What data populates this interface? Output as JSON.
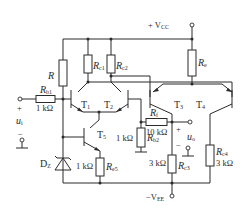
{
  "diagram": {
    "type": "circuit-schematic",
    "supplies": {
      "vcc": {
        "prefix": "+ V",
        "sub": "CC"
      },
      "vee": {
        "prefix": "−V",
        "sub": "EE"
      }
    },
    "transistors": [
      {
        "id": "T1",
        "label": "T",
        "sub": "1"
      },
      {
        "id": "T2",
        "label": "T",
        "sub": "2"
      },
      {
        "id": "T3",
        "label": "T",
        "sub": "3"
      },
      {
        "id": "T4",
        "label": "T",
        "sub": "4"
      },
      {
        "id": "T5",
        "label": "T",
        "sub": "5"
      }
    ],
    "resistors": {
      "R": {
        "label": "R",
        "sub": ""
      },
      "Rb1": {
        "label": "R",
        "sub": "b1",
        "value": "1 kΩ"
      },
      "Rc1": {
        "label": "R",
        "sub": "c1"
      },
      "Rc2": {
        "label": "R",
        "sub": "c2"
      },
      "Re": {
        "label": "R",
        "sub": "e"
      },
      "Re5": {
        "label": "R",
        "sub": "e5",
        "value": "1 kΩ"
      },
      "Rb2": {
        "label": "R",
        "sub": "b2",
        "value": "1 kΩ"
      },
      "Rf": {
        "label": "R",
        "sub": "f",
        "value": "10 kΩ"
      },
      "Rc3": {
        "label": "R",
        "sub": "c3",
        "value": "3 kΩ"
      },
      "Rc4": {
        "label": "R",
        "sub": "c4",
        "value": "3 kΩ"
      }
    },
    "diode": {
      "label": "D",
      "sub": "Z"
    },
    "input": {
      "plus": "+",
      "minus": "−",
      "label": "u",
      "sub": "i"
    },
    "output": {
      "plus": "+",
      "minus": "−",
      "label": "u",
      "sub": "o"
    }
  }
}
